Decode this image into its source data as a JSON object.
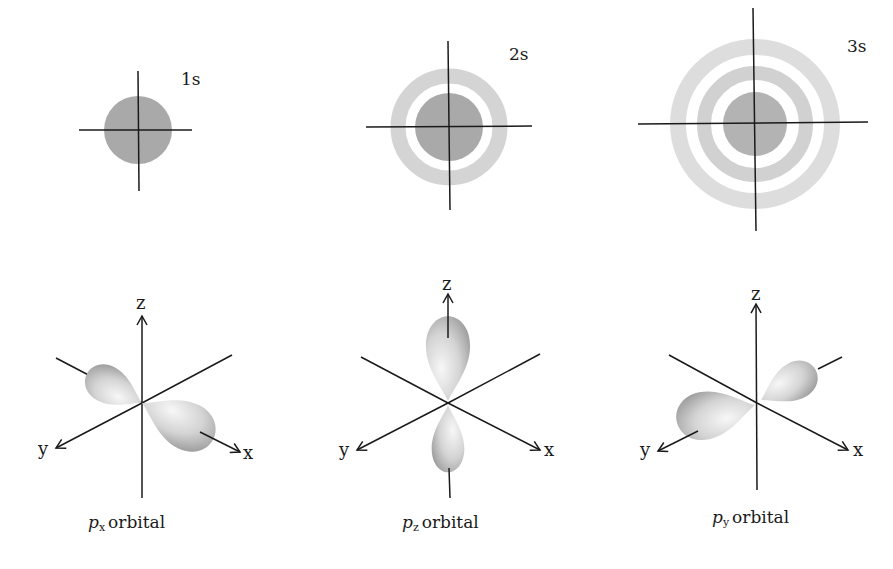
{
  "figure": {
    "s_orbitals": [
      {
        "id": "1s",
        "label": "1s",
        "center": [
          138,
          130
        ],
        "core_radius": 34,
        "rings": []
      },
      {
        "id": "2s",
        "label": "2s",
        "center": [
          449,
          127
        ],
        "core_radius": 34,
        "rings": [
          {
            "inner": 44,
            "outer": 58,
            "opacity": 0.45
          }
        ]
      },
      {
        "id": "3s",
        "label": "3s",
        "center": [
          754,
          124
        ],
        "core_radius": 32,
        "rings": [
          {
            "inner": 44,
            "outer": 58,
            "opacity": 0.5
          },
          {
            "inner": 70,
            "outer": 84,
            "opacity": 0.3
          }
        ]
      }
    ],
    "p_orbitals": [
      {
        "id": "px",
        "letter": "p",
        "subscript": "x",
        "suffix": "orbital",
        "lobe_axis": "x"
      },
      {
        "id": "pz",
        "letter": "p",
        "subscript": "z",
        "suffix": "orbital",
        "lobe_axis": "z"
      },
      {
        "id": "py",
        "letter": "p",
        "subscript": "y",
        "suffix": "orbital",
        "lobe_axis": "y"
      }
    ],
    "axis_labels": {
      "x": "x",
      "y": "y",
      "z": "z"
    },
    "colors": {
      "axis": "#1a1a1a",
      "s_core": "#a9a9a9",
      "s_ring": "#b9b9b9",
      "lobe_light": "#f2f2f2",
      "lobe_dark": "#a6a6a6"
    }
  }
}
